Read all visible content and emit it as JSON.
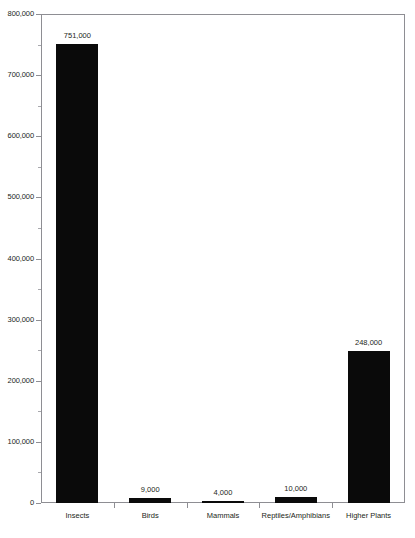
{
  "chart_data": {
    "type": "bar",
    "title": "",
    "xlabel": "",
    "ylabel": "",
    "ylim": [
      0,
      800000
    ],
    "ytick_step": 100000,
    "yminor_step": 50000,
    "grid": false,
    "legend": null,
    "legend_position": "none",
    "bar_color": "#0a0a0a",
    "axis_color": "#8e8e93",
    "text_color": "#231f20",
    "categories": [
      "Insects",
      "Birds",
      "Mammals",
      "Reptiles/Amphibians",
      "Higher Plants"
    ],
    "values": [
      751000,
      9000,
      4000,
      10000,
      248000
    ],
    "value_labels": [
      "751,000",
      "9,000",
      "4,000",
      "10,000",
      "248,000"
    ],
    "ytick_labels": [
      "800,000",
      "700,000",
      "600,000",
      "500,000",
      "400,000",
      "300,000",
      "200,000",
      "100,000",
      "0"
    ],
    "ytick_values": [
      800000,
      700000,
      600000,
      500000,
      400000,
      300000,
      200000,
      100000,
      0
    ]
  },
  "clipped_header": {
    "text": "· · ·        · ·         · · ·"
  }
}
